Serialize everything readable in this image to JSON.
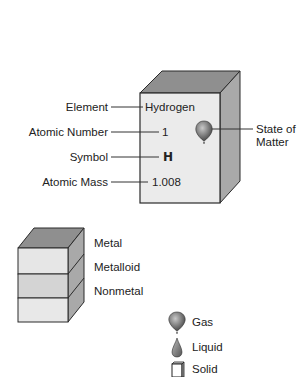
{
  "element_key": {
    "element_name": "Hydrogen",
    "atomic_number": "1",
    "symbol": "H",
    "atomic_mass": "1.008",
    "state_icon": "balloon-gas-icon",
    "labels": {
      "element": "Element",
      "atomic_number": "Atomic Number",
      "symbol": "Symbol",
      "atomic_mass": "Atomic Mass",
      "state_line1": "State of",
      "state_line2": "Matter"
    }
  },
  "classification_key": {
    "items": [
      {
        "label": "Metal",
        "color": "#e6e6e6"
      },
      {
        "label": "Metalloid",
        "color": "#d4d4d4"
      },
      {
        "label": "Nonmetal",
        "color": "#e8e8e8"
      }
    ]
  },
  "state_key": {
    "items": [
      {
        "label": "Gas",
        "icon": "balloon-icon"
      },
      {
        "label": "Liquid",
        "icon": "drop-icon"
      },
      {
        "label": "Solid",
        "icon": "cube-icon"
      }
    ]
  },
  "colors": {
    "front_face": "#ebebeb",
    "top_face": "#8f8f8f",
    "side_face": "#a9a9a9",
    "outline": "#2a2a2a",
    "line": "#333333"
  }
}
